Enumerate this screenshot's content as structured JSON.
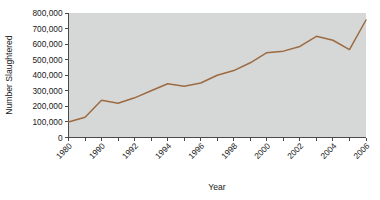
{
  "chart_data": {
    "type": "line",
    "title": "",
    "xlabel": "Year",
    "ylabel": "Number Slaughtered",
    "x": [
      1980,
      1989,
      1990,
      1991,
      1992,
      1993,
      1994,
      1995,
      1996,
      1997,
      1998,
      1999,
      2000,
      2001,
      2002,
      2003,
      2004,
      2005,
      2006
    ],
    "values": [
      100000,
      130000,
      240000,
      220000,
      255000,
      300000,
      345000,
      330000,
      350000,
      400000,
      430000,
      480000,
      545000,
      555000,
      585000,
      650000,
      625000,
      565000,
      755000
    ],
    "series": [
      {
        "name": "Number Slaughtered",
        "color": "#9c6b42",
        "values": [
          100000,
          130000,
          240000,
          220000,
          255000,
          300000,
          345000,
          330000,
          350000,
          400000,
          430000,
          480000,
          545000,
          555000,
          585000,
          650000,
          625000,
          565000,
          755000
        ]
      }
    ],
    "ylim": [
      0,
      800000
    ],
    "ytick_values": [
      0,
      100000,
      200000,
      300000,
      400000,
      500000,
      600000,
      700000,
      800000
    ],
    "ytick_labels": [
      "0",
      "100,000",
      "200,000",
      "300,000",
      "400,000",
      "500,000",
      "600,000",
      "700,000",
      "800,000"
    ],
    "xtick_values": [
      1980,
      1989,
      1990,
      1991,
      1992,
      1993,
      1994,
      1995,
      1996,
      1997,
      1998,
      1999,
      2000,
      2001,
      2002,
      2003,
      2004,
      2005,
      2006
    ],
    "xtick_labels": [
      "1980",
      "",
      "1990",
      "",
      "1992",
      "",
      "1994",
      "",
      "1996",
      "",
      "1998",
      "",
      "2000",
      "",
      "2002",
      "",
      "2004",
      "",
      "2006"
    ],
    "xtick_label_rotation": -45,
    "grid": false,
    "legend": "none",
    "plot_background_color": "#d6d8d7",
    "page_background_color": "#ffffff",
    "axis_color": "#4a4a4a"
  }
}
